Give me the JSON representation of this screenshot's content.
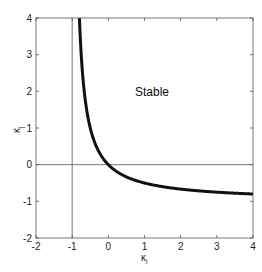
{
  "chart_data": {
    "type": "line",
    "title": "",
    "xlabel": "κi",
    "ylabel": "κj",
    "xlim": [
      -2,
      4
    ],
    "ylim": [
      -2,
      4
    ],
    "xticks": [
      "-2",
      "-1",
      "0",
      "1",
      "2",
      "3",
      "4"
    ],
    "yticks": [
      "-2",
      "-1",
      "0",
      "1",
      "2",
      "3",
      "4"
    ],
    "grid": false,
    "legend": null,
    "reference_lines": [
      {
        "orientation": "vertical",
        "x": -1
      },
      {
        "orientation": "horizontal",
        "y": 0
      }
    ],
    "annotations": [
      {
        "text": "Stable",
        "x": 1.3,
        "y": 2.4
      }
    ],
    "series": [
      {
        "name": "stability boundary",
        "style": "thick black",
        "x": [
          -0.8,
          -0.75,
          -0.7,
          -0.6,
          -0.5,
          -0.4,
          -0.3,
          -0.2,
          -0.1,
          0,
          0.25,
          0.5,
          1,
          1.5,
          2,
          2.5,
          3,
          3.5,
          4
        ],
        "y": [
          4,
          3,
          2.33,
          1.5,
          1,
          0.67,
          0.43,
          0.25,
          0.11,
          0,
          -0.2,
          -0.33,
          -0.5,
          -0.6,
          -0.67,
          -0.71,
          -0.75,
          -0.78,
          -0.8
        ]
      }
    ]
  },
  "labels": {
    "stable": "Stable",
    "xlabel_main": "κ",
    "xlabel_sub": "i",
    "ylabel_main": "κ",
    "ylabel_sub": "j"
  }
}
